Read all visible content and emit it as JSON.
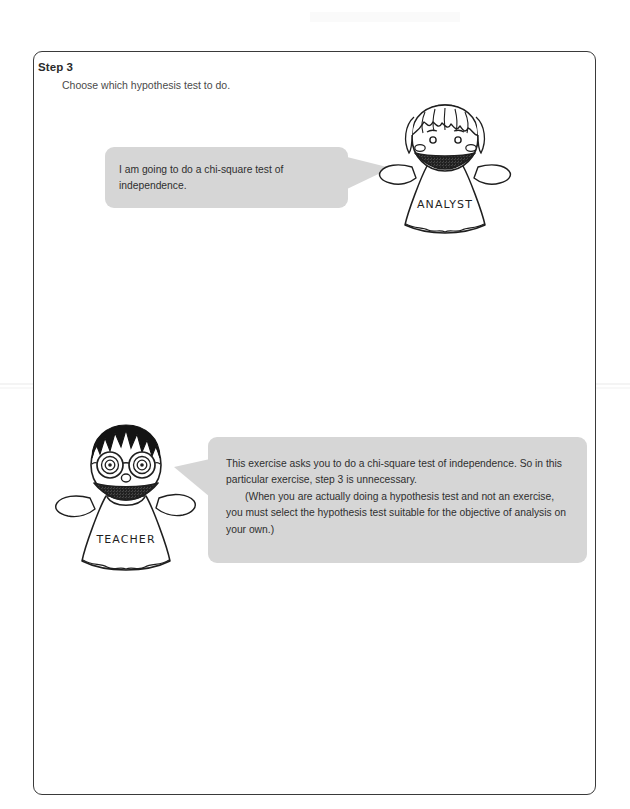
{
  "page": {
    "background_color": "#ffffff",
    "frame_border_color": "#3a3a3a",
    "bubble_color": "#d6d6d6",
    "text_color": "#2f2f2f"
  },
  "header": {
    "step_label": "Step 3",
    "step_description": "Choose which hypothesis test to do."
  },
  "dialogue": [
    {
      "speaker_label": "ANALYST",
      "speaker_role": "analyst",
      "bubble_side": "left",
      "tail_direction": "right",
      "paragraphs": [
        {
          "indent": false,
          "text": "I am going to do a chi-square test of independence."
        }
      ]
    },
    {
      "speaker_label": "TEACHER",
      "speaker_role": "teacher",
      "bubble_side": "right",
      "tail_direction": "left",
      "paragraphs": [
        {
          "indent": false,
          "text": "This exercise asks you to do a chi-square test of independence. So in this particular exercise, step 3 is unnecessary."
        },
        {
          "indent": true,
          "text": "(When you are actually doing a hypothesis test and not an exercise, you must select the hypothesis test suitable for the objective of analysis on your own.)"
        }
      ]
    }
  ],
  "characters": {
    "analyst": {
      "name_on_shirt": "ANALYST",
      "hair_style": "bangs-fringe",
      "eyes": "round-dots",
      "mouth": "wide-open-smile",
      "cheeks": "blush-ovals",
      "pose": "arms-raised"
    },
    "teacher": {
      "name_on_shirt": "TEACHER",
      "hair_style": "spiky-black-crown",
      "eyes": "spiral-behind-round-glasses",
      "mouth": "wide-open-smile",
      "nose": "small-oval",
      "pose": "arms-raised"
    }
  },
  "icons": {
    "analyst_figure": "analyst-character-icon",
    "teacher_figure": "teacher-character-icon"
  }
}
